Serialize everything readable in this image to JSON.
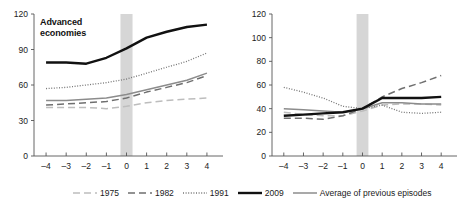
{
  "chart_data": [
    {
      "type": "line",
      "title": "Advanced\neconomies",
      "xlabel": "",
      "ylabel": "",
      "x": [
        -4,
        -3,
        -2,
        -1,
        0,
        1,
        2,
        3,
        4
      ],
      "xlim": [
        -4.6,
        4.6
      ],
      "ylim": [
        0,
        120
      ],
      "yticks": [
        0,
        30,
        60,
        90,
        120
      ],
      "xticks": [
        -4,
        -3,
        -2,
        -1,
        0,
        1,
        2,
        3,
        4
      ],
      "grid": false,
      "legend_position": "bottom",
      "recession_band": [
        -0.3,
        0.3
      ],
      "series": [
        {
          "name": "1975",
          "values": [
            41,
            41,
            41,
            40,
            42,
            45,
            47,
            48,
            49
          ]
        },
        {
          "name": "1982",
          "values": [
            43,
            44,
            45,
            46,
            49,
            54,
            58,
            62,
            68
          ]
        },
        {
          "name": "1991",
          "values": [
            57,
            58,
            60,
            62,
            65,
            70,
            75,
            80,
            87
          ]
        },
        {
          "name": "2009",
          "values": [
            79,
            79,
            78,
            83,
            91,
            100,
            105,
            109,
            111
          ]
        },
        {
          "name": "Average of previous episodes",
          "values": [
            47,
            47,
            48,
            49,
            52,
            56,
            60,
            64,
            70
          ]
        }
      ]
    },
    {
      "type": "line",
      "title": "Emerging market\neconomies",
      "xlabel": "",
      "ylabel": "",
      "x": [
        -4,
        -3,
        -2,
        -1,
        0,
        1,
        2,
        3,
        4
      ],
      "xlim": [
        -4.6,
        4.6
      ],
      "ylim": [
        0,
        120
      ],
      "yticks": [
        0,
        20,
        40,
        60,
        80,
        100,
        120
      ],
      "xticks": [
        -4,
        -3,
        -2,
        -1,
        0,
        1,
        2,
        3,
        4
      ],
      "grid": false,
      "legend_position": "bottom",
      "recession_band": [
        -0.3,
        0.3
      ],
      "series": [
        {
          "name": "1975",
          "values": [
            37,
            35,
            34,
            34,
            38,
            43,
            44,
            44,
            43
          ]
        },
        {
          "name": "1982",
          "values": [
            32,
            32,
            31,
            34,
            40,
            50,
            57,
            62,
            68
          ]
        },
        {
          "name": "1991",
          "values": [
            58,
            54,
            49,
            42,
            40,
            43,
            37,
            36,
            37
          ]
        },
        {
          "name": "2009",
          "values": [
            34,
            35,
            36,
            37,
            40,
            49,
            49,
            49,
            50
          ]
        },
        {
          "name": "Average of previous episodes",
          "values": [
            40,
            39,
            38,
            37,
            40,
            45,
            45,
            44,
            44
          ]
        }
      ]
    }
  ],
  "legend": {
    "items": [
      {
        "label": "1975",
        "style": "long-dash-light",
        "color": "#b9b9b9"
      },
      {
        "label": "1982",
        "style": "long-dash-dark",
        "color": "#6a6a6a"
      },
      {
        "label": "1991",
        "style": "dotted",
        "color": "#707070"
      },
      {
        "label": "2009",
        "style": "solid-thick",
        "color": "#111111"
      },
      {
        "label": "Average of previous episodes",
        "style": "solid-medium",
        "color": "#8a8a8a"
      }
    ]
  },
  "colors": {
    "axis": "#555555",
    "band": "#d6d6d6",
    "text": "#1a1a1a",
    "background": "#ffffff"
  }
}
